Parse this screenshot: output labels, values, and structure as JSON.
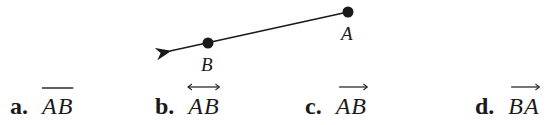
{
  "figure": {
    "points": [
      {
        "name": "A",
        "label": "A"
      },
      {
        "name": "B",
        "label": "B"
      }
    ]
  },
  "choices": [
    {
      "letter": "a.",
      "notation": "AB",
      "mark": "segment"
    },
    {
      "letter": "b.",
      "notation": "AB",
      "mark": "line"
    },
    {
      "letter": "c.",
      "notation": "AB",
      "mark": "ray"
    },
    {
      "letter": "d.",
      "notation": "BA",
      "mark": "ray"
    }
  ],
  "colors": {
    "ink": "#1a1a1a",
    "background": "#ffffff"
  }
}
